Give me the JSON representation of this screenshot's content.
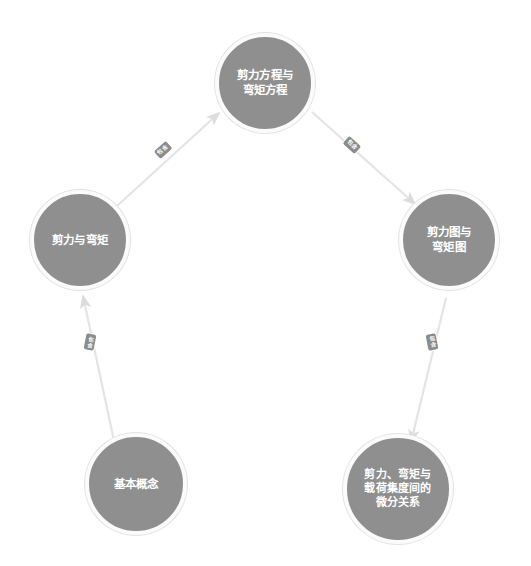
{
  "diagram": {
    "type": "flow-graph",
    "background_color": "#ffffff",
    "node_fill_color": "#8f8f8f",
    "node_ring_color": "#fbfbfb",
    "node_text_color": "#ffffff",
    "edge_color": "#e0e0e0",
    "edge_label_fill": "#8c8c8c",
    "edge_label_text_color": "#ffffff",
    "nodes": [
      {
        "id": "node-top",
        "label": "剪力方程与\n弯矩方程",
        "line1": "剪力方程与",
        "line2": "弯矩方程"
      },
      {
        "id": "node-left",
        "label": "剪力与弯矩",
        "line1": "剪力与弯矩"
      },
      {
        "id": "node-right",
        "label": "剪力图与\n弯矩图",
        "line1": "剪力图与",
        "line2": "弯矩图"
      },
      {
        "id": "node-bottom-left",
        "label": "基本概念",
        "line1": "基本概念"
      },
      {
        "id": "node-bottom-right",
        "label": "剪力、弯矩与\n载荷集度间的\n微分关系",
        "line1": "剪力、弯矩与",
        "line2": "载荷集度间的",
        "line3": "微分关系"
      }
    ],
    "edges": [
      {
        "id": "edge-bottomleft-to-left",
        "from": "基本概念",
        "to": "剪力与弯矩",
        "label": "包含"
      },
      {
        "id": "edge-left-to-top",
        "from": "剪力与弯矩",
        "to": "剪力方程与弯矩方程",
        "label": "包含"
      },
      {
        "id": "edge-top-to-right",
        "from": "剪力方程与弯矩方程",
        "to": "剪力图与弯矩图",
        "label": "包含"
      },
      {
        "id": "edge-right-to-bottomright",
        "from": "剪力图与弯矩图",
        "to": "剪力、弯矩与载荷集度间的微分关系",
        "label": "包含"
      }
    ]
  }
}
